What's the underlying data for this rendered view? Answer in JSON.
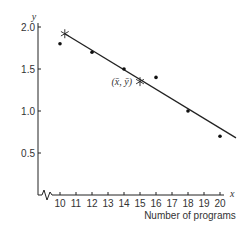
{
  "chart_data": {
    "type": "scatter",
    "title": "",
    "xlabel": "Number of programs",
    "x_axis_var": "x",
    "ylabel": "",
    "y_axis_var": "y",
    "xlim": [
      10,
      20
    ],
    "ylim": [
      0,
      2.0
    ],
    "x_ticks": [
      10,
      11,
      12,
      13,
      14,
      15,
      16,
      17,
      18,
      19,
      20
    ],
    "y_ticks": [
      0.5,
      1.0,
      1.5,
      2.0
    ],
    "y_tick_labels": [
      "0.5",
      "1.0",
      "1.5",
      "2.0"
    ],
    "axis_break": true,
    "grid": false,
    "legend": null,
    "series": [
      {
        "name": "observations",
        "marker": "dot",
        "points": [
          {
            "x": 10,
            "y": 1.8
          },
          {
            "x": 12,
            "y": 1.7
          },
          {
            "x": 14,
            "y": 1.5
          },
          {
            "x": 16,
            "y": 1.4
          },
          {
            "x": 18,
            "y": 1.0
          },
          {
            "x": 20,
            "y": 0.7
          }
        ]
      }
    ],
    "regression_line": {
      "start": {
        "x": 10.3,
        "y": 1.92
      },
      "end": {
        "x": 21.0,
        "y": 0.68
      }
    },
    "star_markers": [
      {
        "x": 10.3,
        "y": 1.92
      },
      {
        "x": 15,
        "y": 1.35
      }
    ],
    "annotations": [
      {
        "text": "(x̄, ȳ)",
        "x": 15,
        "y": 1.35
      }
    ]
  }
}
